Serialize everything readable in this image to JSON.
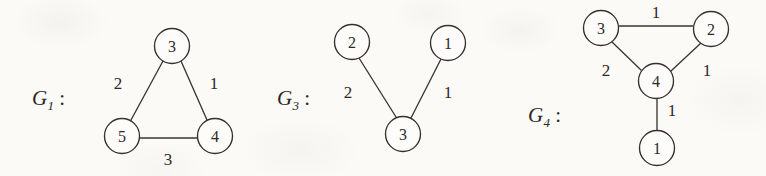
{
  "figure": {
    "background_color": "#fbfaf7",
    "ink_color": "#2c2926"
  },
  "graphs": [
    {
      "id": "G1",
      "label_base": "G",
      "label_subscript": "1",
      "label_colon": ":",
      "label_x": 32,
      "label_y": 86,
      "nodes": [
        {
          "name": "node-3",
          "value": "3",
          "cx": 172,
          "cy": 46,
          "r": 17.5
        },
        {
          "name": "node-5",
          "value": "5",
          "cx": 122,
          "cy": 136,
          "r": 17.5
        },
        {
          "name": "node-4",
          "value": "4",
          "cx": 215,
          "cy": 136,
          "r": 17.5
        }
      ],
      "edges": [
        {
          "name": "edge-3-5",
          "from": "3",
          "to": "5",
          "weight": "2",
          "x1": 163,
          "y1": 61,
          "x2": 131,
          "y2": 120,
          "wx": 118,
          "wy": 83
        },
        {
          "name": "edge-3-4",
          "from": "3",
          "to": "4",
          "weight": "1",
          "x1": 181,
          "y1": 61,
          "x2": 207,
          "y2": 120,
          "wx": 214,
          "wy": 83
        },
        {
          "name": "edge-5-4",
          "from": "5",
          "to": "4",
          "weight": "3",
          "x1": 140,
          "y1": 138,
          "x2": 197,
          "y2": 138,
          "wx": 168,
          "wy": 159
        }
      ]
    },
    {
      "id": "G3",
      "label_base": "G",
      "label_subscript": "3",
      "label_colon": ":",
      "label_x": 277,
      "label_y": 86,
      "nodes": [
        {
          "name": "node-2",
          "value": "2",
          "cx": 352,
          "cy": 42,
          "r": 17.5
        },
        {
          "name": "node-1",
          "value": "1",
          "cx": 448,
          "cy": 43,
          "r": 17.5
        },
        {
          "name": "node-3",
          "value": "3",
          "cx": 403,
          "cy": 134,
          "r": 17.5
        }
      ],
      "edges": [
        {
          "name": "edge-2-3",
          "from": "2",
          "to": "3",
          "weight": "2",
          "x1": 359,
          "y1": 58,
          "x2": 396,
          "y2": 117,
          "wx": 348,
          "wy": 92
        },
        {
          "name": "edge-1-3",
          "from": "1",
          "to": "3",
          "weight": "1",
          "x1": 441,
          "y1": 59,
          "x2": 411,
          "y2": 118,
          "wx": 448,
          "wy": 92
        }
      ]
    },
    {
      "id": "G4",
      "label_base": "G",
      "label_subscript": "4",
      "label_colon": ":",
      "label_x": 528,
      "label_y": 103,
      "nodes": [
        {
          "name": "node-3",
          "value": "3",
          "cx": 601,
          "cy": 28,
          "r": 17.5
        },
        {
          "name": "node-2",
          "value": "2",
          "cx": 711,
          "cy": 29,
          "r": 17.5
        },
        {
          "name": "node-4",
          "value": "4",
          "cx": 656,
          "cy": 81,
          "r": 17.5
        },
        {
          "name": "node-1",
          "value": "1",
          "cx": 657,
          "cy": 148,
          "r": 17.5
        }
      ],
      "edges": [
        {
          "name": "edge-3-2",
          "from": "3",
          "to": "2",
          "weight": "1",
          "x1": 619,
          "y1": 26,
          "x2": 693,
          "y2": 26,
          "wx": 656,
          "wy": 12
        },
        {
          "name": "edge-3-4",
          "from": "3",
          "to": "4",
          "weight": "2",
          "x1": 612,
          "y1": 42,
          "x2": 641,
          "y2": 70,
          "wx": 606,
          "wy": 70
        },
        {
          "name": "edge-2-4",
          "from": "2",
          "to": "4",
          "weight": "1",
          "x1": 701,
          "y1": 43,
          "x2": 671,
          "y2": 71,
          "wx": 707,
          "wy": 70
        },
        {
          "name": "edge-4-1",
          "from": "4",
          "to": "1",
          "weight": "1",
          "x1": 657,
          "y1": 99,
          "x2": 657,
          "y2": 131,
          "wx": 672,
          "wy": 110
        }
      ]
    }
  ]
}
